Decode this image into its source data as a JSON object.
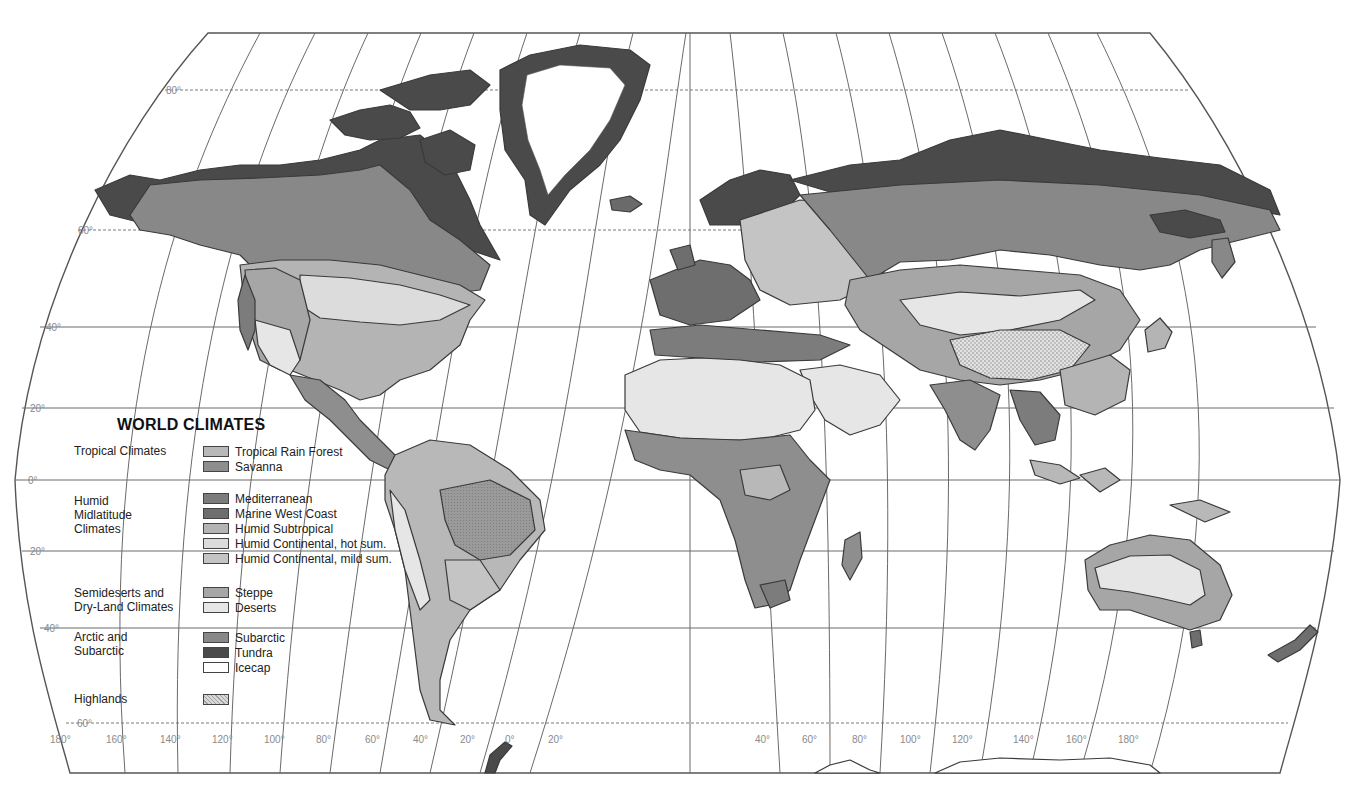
{
  "legend": {
    "title": "WORLD CLIMATES",
    "groups": [
      {
        "label": "Tropical Climates",
        "items": [
          {
            "label": "Tropical Rain Forest",
            "color": "#b8b8b8"
          },
          {
            "label": "Savanna",
            "color": "#8e8e8e"
          }
        ]
      },
      {
        "label": "Humid Midlatitude Climates",
        "label_lines": [
          "Humid",
          "Midlatitude",
          "Climates"
        ],
        "items": [
          {
            "label": "Mediterranean",
            "color": "#7c7c7c"
          },
          {
            "label": "Marine West Coast",
            "color": "#6e6e6e"
          },
          {
            "label": "Humid Subtropical",
            "color": "#b4b4b4"
          },
          {
            "label": "Humid Continental, hot sum.",
            "color": "#dcdcdc"
          },
          {
            "label": "Humid Continental, mild sum.",
            "color": "#c4c4c4"
          }
        ]
      },
      {
        "label": "Semideserts and Dry-Land Climates",
        "label_lines": [
          "Semideserts and",
          "Dry-Land Climates"
        ],
        "items": [
          {
            "label": "Steppe",
            "color": "#a6a6a6"
          },
          {
            "label": "Deserts",
            "color": "#e6e6e6"
          }
        ]
      },
      {
        "label": "Arctic and Subarctic",
        "label_lines": [
          "Arctic and",
          "Subarctic"
        ],
        "items": [
          {
            "label": "Subarctic",
            "color": "#888888"
          },
          {
            "label": "Tundra",
            "color": "#4a4a4a"
          },
          {
            "label": "Icecap",
            "color": "#ffffff"
          }
        ]
      },
      {
        "label": "Highlands",
        "items": [
          {
            "label": "",
            "color": "#d2d2d2",
            "pattern": "dotted"
          }
        ]
      }
    ]
  },
  "latitude_labels": [
    "80°",
    "60°",
    "40°",
    "20°",
    "0°",
    "20°",
    "40°",
    "60°"
  ],
  "longitude_labels": [
    "180°",
    "160°",
    "140°",
    "120°",
    "100°",
    "80°",
    "60°",
    "40°",
    "20°",
    "0°",
    "20°",
    "40°",
    "60°",
    "80°",
    "100°",
    "120°",
    "140°",
    "160°",
    "180°"
  ]
}
